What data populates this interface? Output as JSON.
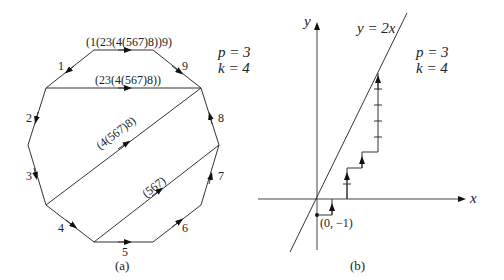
{
  "panel_a": {
    "caption": "(a)",
    "params": {
      "p": "p = 3",
      "k": "k = 4"
    },
    "edges": [
      {
        "label": "1"
      },
      {
        "label": "2"
      },
      {
        "label": "3"
      },
      {
        "label": "4"
      },
      {
        "label": "5"
      },
      {
        "label": "6"
      },
      {
        "label": "7"
      },
      {
        "label": "8"
      },
      {
        "label": "9"
      }
    ],
    "chords": [
      {
        "label": "(1(23(4(567)8))9)"
      },
      {
        "label": "(23(4(567)8))"
      },
      {
        "label": "(4(567)8)"
      },
      {
        "label": "(567)"
      }
    ]
  },
  "panel_b": {
    "caption": "(b)",
    "params": {
      "p": "p = 3",
      "k": "k = 4"
    },
    "line_label": "y = 2x",
    "x_axis_label": "x",
    "y_axis_label": "y",
    "start_point_label": "(0, −1)"
  }
}
